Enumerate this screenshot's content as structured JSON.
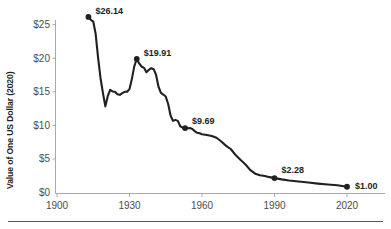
{
  "chart_data": {
    "type": "line",
    "title": "",
    "xlabel": "",
    "ylabel": "Value of One US Dollar (2020)",
    "xlim": [
      1900,
      2032
    ],
    "ylim": [
      0,
      27
    ],
    "grid": false,
    "legend": "none",
    "xticks": [
      "1900",
      "1930",
      "1960",
      "1990",
      "2020"
    ],
    "xtick_values": [
      1900,
      1930,
      1960,
      1990,
      2020
    ],
    "yticks": [
      "$0",
      "$5",
      "$10",
      "$15",
      "$20",
      "$25"
    ],
    "ytick_values": [
      0,
      5,
      10,
      15,
      20,
      25
    ],
    "series": [
      {
        "name": "Value of One US Dollar (2020)",
        "x": [
          1913,
          1914,
          1915,
          1916,
          1917,
          1918,
          1919,
          1920,
          1921,
          1922,
          1923,
          1924,
          1925,
          1926,
          1927,
          1928,
          1929,
          1930,
          1931,
          1932,
          1933,
          1934,
          1935,
          1936,
          1937,
          1938,
          1939,
          1940,
          1941,
          1942,
          1943,
          1944,
          1945,
          1946,
          1947,
          1948,
          1949,
          1950,
          1951,
          1952,
          1953,
          1954,
          1955,
          1956,
          1957,
          1958,
          1959,
          1960,
          1962,
          1964,
          1966,
          1968,
          1970,
          1972,
          1974,
          1976,
          1978,
          1980,
          1982,
          1984,
          1986,
          1988,
          1990,
          1993,
          1996,
          2000,
          2004,
          2008,
          2012,
          2016,
          2020
        ],
        "y": [
          26.14,
          25.7,
          25.45,
          23.6,
          20.1,
          17.1,
          14.9,
          12.9,
          14.4,
          15.35,
          15.1,
          15.05,
          14.7,
          14.6,
          14.85,
          15.05,
          15.05,
          15.45,
          17.0,
          18.85,
          19.91,
          19.25,
          18.8,
          18.6,
          17.95,
          18.3,
          18.55,
          18.4,
          17.55,
          15.8,
          14.9,
          14.65,
          14.35,
          13.25,
          11.55,
          10.75,
          10.9,
          10.75,
          9.95,
          9.75,
          9.69,
          9.65,
          9.68,
          9.54,
          9.23,
          8.98,
          8.92,
          8.77,
          8.66,
          8.52,
          8.25,
          7.7,
          7.05,
          6.55,
          5.65,
          4.95,
          4.3,
          3.45,
          2.93,
          2.7,
          2.58,
          2.42,
          2.28,
          2.09,
          1.93,
          1.78,
          1.62,
          1.46,
          1.33,
          1.23,
          1.0
        ]
      }
    ],
    "annotated_points": [
      {
        "label": "$26.14",
        "x": 1913,
        "y": 26.14
      },
      {
        "label": "$19.91",
        "x": 1933,
        "y": 19.91
      },
      {
        "label": "$9.69",
        "x": 1953,
        "y": 9.69
      },
      {
        "label": "$2.28",
        "x": 1990,
        "y": 2.28
      },
      {
        "label": "$1.00",
        "x": 2020,
        "y": 1.0
      }
    ],
    "colors": {
      "line": "#231f20",
      "marker": "#231f20",
      "axis": "#a7a9ac",
      "tick_text": "#4d4d4d",
      "label_text": "#231f20",
      "rule": "#58595b",
      "background": "#ffffff"
    }
  }
}
